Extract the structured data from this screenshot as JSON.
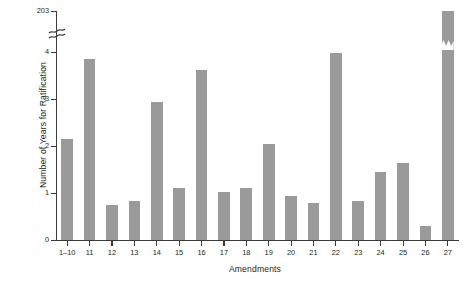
{
  "chart_data": {
    "type": "bar",
    "title": "",
    "xlabel": "Amendments",
    "ylabel": "Number of Years for Ratification",
    "categories": [
      "1–10",
      "11",
      "12",
      "13",
      "14",
      "15",
      "16",
      "17",
      "18",
      "19",
      "20",
      "21",
      "22",
      "23",
      "24",
      "25",
      "26",
      "27"
    ],
    "values": [
      2.15,
      3.85,
      0.75,
      0.83,
      2.93,
      1.1,
      3.62,
      1.03,
      1.1,
      2.05,
      0.93,
      0.78,
      3.98,
      0.82,
      1.45,
      1.63,
      0.3,
      203
    ],
    "ylim": [
      0,
      4
    ],
    "y_ticks": [
      "0",
      "1",
      "2",
      "3",
      "4",
      "203"
    ],
    "y_tick_values": [
      0,
      1,
      2,
      3,
      4,
      203
    ],
    "axis_break": true,
    "axis_break_note": "y axis broken between 4 and 203",
    "clipped_bar_index": 16,
    "grid": false,
    "legend": null,
    "bar_color": "#9a9a9a",
    "axis_color": "#3b3b3b",
    "background_color": "#ffffff"
  }
}
